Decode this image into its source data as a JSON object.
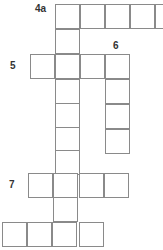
{
  "puzzle": {
    "type": "crossword",
    "clue_numbers": {
      "n4a": "4a",
      "n5": "5",
      "n6": "6",
      "n7": "7"
    },
    "cells": [
      {
        "x": 55,
        "y": 4
      },
      {
        "x": 80,
        "y": 4
      },
      {
        "x": 105,
        "y": 4
      },
      {
        "x": 130,
        "y": 4
      },
      {
        "x": 155,
        "y": 4
      },
      {
        "x": 55,
        "y": 29
      },
      {
        "x": 30,
        "y": 54
      },
      {
        "x": 55,
        "y": 54
      },
      {
        "x": 80,
        "y": 54
      },
      {
        "x": 105,
        "y": 54
      },
      {
        "x": 55,
        "y": 79
      },
      {
        "x": 105,
        "y": 79
      },
      {
        "x": 55,
        "y": 103
      },
      {
        "x": 105,
        "y": 104
      },
      {
        "x": 55,
        "y": 127
      },
      {
        "x": 105,
        "y": 129
      },
      {
        "x": 55,
        "y": 150
      },
      {
        "x": 28,
        "y": 173
      },
      {
        "x": 53,
        "y": 173
      },
      {
        "x": 79,
        "y": 173
      },
      {
        "x": 104,
        "y": 173
      },
      {
        "x": 53,
        "y": 197
      },
      {
        "x": 2,
        "y": 222
      },
      {
        "x": 27,
        "y": 222
      },
      {
        "x": 52,
        "y": 222
      },
      {
        "x": 79,
        "y": 222
      }
    ]
  }
}
